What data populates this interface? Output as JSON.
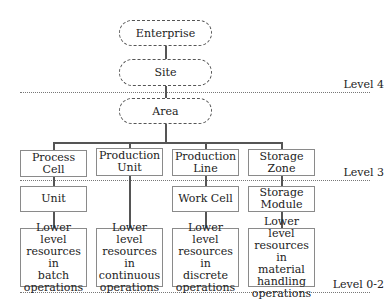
{
  "diagram": {
    "top_nodes": {
      "enterprise": "Enterprise",
      "site": "Site",
      "area": "Area"
    },
    "level3_nodes": [
      {
        "label": "Process\nCell"
      },
      {
        "label": "Production\nUnit"
      },
      {
        "label": "Production\nLine"
      },
      {
        "label": "Storage\nZone"
      }
    ],
    "level2_nodes": [
      {
        "label": "Unit"
      },
      {
        "label": "Work Cell"
      },
      {
        "label": "Storage\nModule"
      }
    ],
    "bottom_nodes": [
      {
        "label": "Lower level\nresources in\nbatch\noperations"
      },
      {
        "label": "Lower level\nresources in\ncontinuous\noperations"
      },
      {
        "label": "Lower level\nresources in\ndiscrete\noperations"
      },
      {
        "label": "Lower level\nresources in\nmaterial\nhandling\noperations"
      }
    ],
    "levels": {
      "level4": "Level 4",
      "level3": "Level 3",
      "level02": "Level 0-2"
    }
  }
}
